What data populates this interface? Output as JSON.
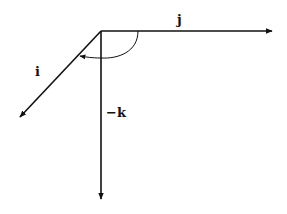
{
  "diagram": {
    "type": "vector-axes",
    "origin": [
      101,
      31
    ],
    "stroke_color": "#111111",
    "background": "#ffffff",
    "axes": [
      {
        "id": "j",
        "label": "j",
        "from": [
          101,
          31
        ],
        "to": [
          272,
          31
        ],
        "label_pos": [
          177,
          24
        ]
      },
      {
        "id": "i",
        "label": "i",
        "from": [
          101,
          31
        ],
        "to": [
          20,
          117
        ],
        "label_pos": [
          35,
          76
        ]
      },
      {
        "id": "neg-k",
        "label": "−k",
        "from": [
          101,
          31
        ],
        "to": [
          101,
          199
        ],
        "label_pos": [
          106,
          117
        ]
      }
    ],
    "rotation_arc": {
      "from_axis": "j",
      "to_axis": "i",
      "direction": "clockwise",
      "description": "curved arrow from j-axis sweeping through −k to i-axis"
    }
  }
}
